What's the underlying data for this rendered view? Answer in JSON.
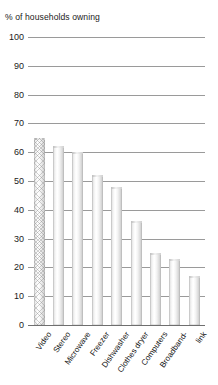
{
  "chart_data": {
    "type": "bar",
    "title": "% of households owning",
    "xlabel": "",
    "ylabel": "",
    "ylim": [
      0,
      100
    ],
    "ytick_step": 10,
    "grid": true,
    "legend": "none",
    "categories": [
      "Video",
      "Stereo",
      "Microwave",
      "Freezer",
      "Dishwasher",
      "Clothes dryer",
      "Computers",
      "Broadband-link",
      "Link"
    ],
    "category_lines": [
      [
        "Video"
      ],
      [
        "Stereo"
      ],
      [
        "Microwave"
      ],
      [
        "Freezer"
      ],
      [
        "Dishwasher"
      ],
      [
        "Clothes dryer"
      ],
      [
        "Computers"
      ],
      [
        "Broadband-"
      ],
      [
        "link"
      ]
    ],
    "values": [
      65,
      62,
      60,
      52,
      48,
      36,
      25,
      23,
      17
    ],
    "yticks": [
      "100",
      "90",
      "80",
      "70",
      "60",
      "50",
      "40",
      "30",
      "20",
      "10",
      "0"
    ],
    "ytick_values": [
      100,
      90,
      80,
      70,
      60,
      50,
      40,
      30,
      20,
      10,
      0
    ],
    "bar_styles": [
      "hatched",
      "plain",
      "plain",
      "plain",
      "plain",
      "plain",
      "plain",
      "plain",
      "plain"
    ],
    "colors": {
      "bar_fill_light": "#ffffff",
      "bar_fill_dark": "#c4c4c4",
      "gridline": "#9a9a9a",
      "axis": "#6f6f6f",
      "text": "#1b1b1b",
      "background": "#ffffff"
    }
  }
}
